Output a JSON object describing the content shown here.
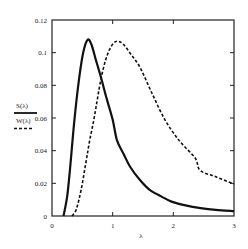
{
  "chart_data": {
    "type": "line",
    "title": "",
    "xlabel": "λ",
    "ylabel": "",
    "xlim": [
      0,
      3
    ],
    "ylim": [
      0,
      0.12
    ],
    "grid": false,
    "legend_position": "left-outside",
    "x_ticks": [
      "0",
      "1",
      "2",
      "3"
    ],
    "y_ticks": [
      "0",
      "0.02",
      "0.04",
      "0.06",
      "0.08",
      "0.1",
      "0.12"
    ],
    "series": [
      {
        "name": "S(λ)",
        "style": "solid",
        "color": "#111111",
        "x": [
          0.19,
          0.25,
          0.3,
          0.37,
          0.45,
          0.52,
          0.59,
          0.65,
          0.72,
          0.81,
          0.9,
          1.0,
          1.07,
          1.18,
          1.29,
          1.45,
          1.61,
          1.8,
          1.97,
          2.2,
          2.45,
          2.7,
          3.0
        ],
        "y": [
          0.0,
          0.012,
          0.03,
          0.059,
          0.085,
          0.101,
          0.108,
          0.105,
          0.096,
          0.0845,
          0.072,
          0.059,
          0.0465,
          0.038,
          0.03,
          0.022,
          0.016,
          0.012,
          0.0088,
          0.0065,
          0.0048,
          0.0037,
          0.003
        ]
      },
      {
        "name": "W(λ)",
        "style": "dashed",
        "color": "#111111",
        "x": [
          0.33,
          0.4,
          0.48,
          0.56,
          0.62,
          0.69,
          0.75,
          0.81,
          0.88,
          0.95,
          1.02,
          1.09,
          1.18,
          1.3,
          1.45,
          1.65,
          1.86,
          2.1,
          2.36,
          2.44,
          2.7,
          3.0
        ],
        "y": [
          0.0,
          0.004,
          0.016,
          0.033,
          0.046,
          0.059,
          0.072,
          0.0845,
          0.095,
          0.102,
          0.106,
          0.107,
          0.105,
          0.099,
          0.091,
          0.075,
          0.059,
          0.046,
          0.0355,
          0.028,
          0.024,
          0.0196
        ]
      }
    ]
  }
}
